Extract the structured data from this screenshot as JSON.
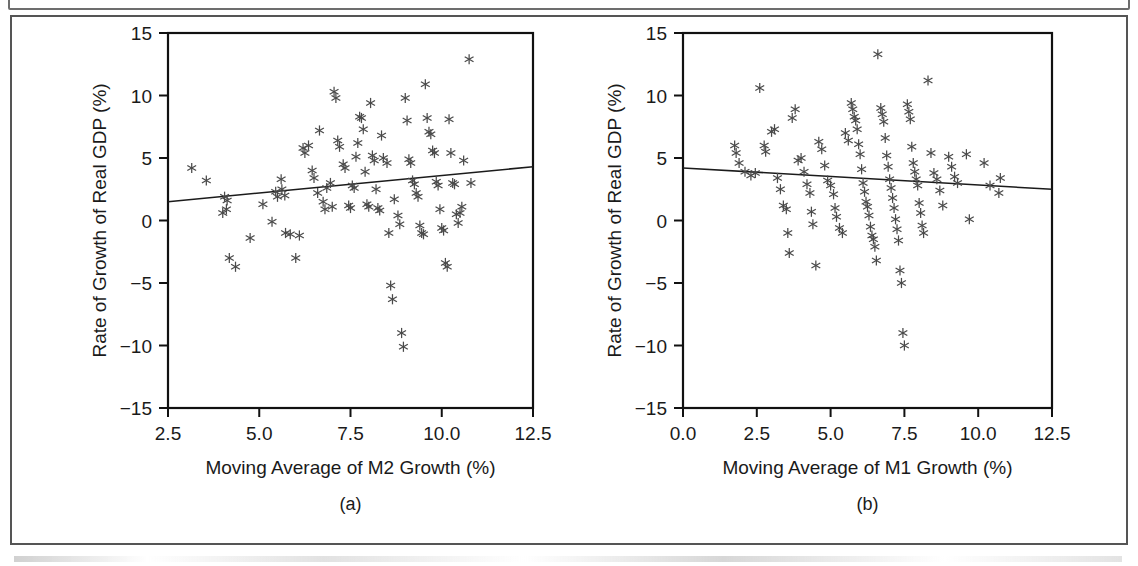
{
  "figure": {
    "panels": [
      {
        "id": "a",
        "caption": "(a)",
        "xlabel": "Moving Average of M2 Growth (%)",
        "ylabel": "Rate of Growth of Real GDP (%)",
        "xticks": [
          "2.5",
          "5.0",
          "7.5",
          "10.0",
          "12.5"
        ],
        "yticks": [
          "15",
          "10",
          "5",
          "0",
          "−5",
          "−10",
          "−15"
        ]
      },
      {
        "id": "b",
        "caption": "(b)",
        "xlabel": "Moving Average of M1 Growth (%)",
        "ylabel": "Rate of Growth of Real GDP (%)",
        "xticks": [
          "0.0",
          "2.5",
          "5.0",
          "7.5",
          "10.0",
          "12.5"
        ],
        "yticks": [
          "15",
          "10",
          "5",
          "0",
          "−5",
          "−10",
          "−15"
        ]
      }
    ]
  },
  "chart_data": [
    {
      "type": "scatter",
      "panel": "a",
      "title": "",
      "xlabel": "Moving Average of M2 Growth (%)",
      "ylabel": "Rate of Growth of Real GDP (%)",
      "xlim": [
        2.5,
        12.5
      ],
      "ylim": [
        -15,
        15
      ],
      "xticks": [
        2.5,
        5.0,
        7.5,
        10.0,
        12.5
      ],
      "yticks": [
        15,
        10,
        5,
        0,
        -5,
        -10,
        -15
      ],
      "grid": false,
      "legend": "none",
      "marker": "asterisk",
      "marker_color": "#4a4a4a",
      "fit_line": {
        "x": [
          2.5,
          12.5
        ],
        "y": [
          1.5,
          4.3
        ],
        "color": "#1b1b1b",
        "slope": 0.28,
        "intercept": 0.8
      },
      "points": [
        [
          3.15,
          4.2
        ],
        [
          3.55,
          3.2
        ],
        [
          4.05,
          1.9
        ],
        [
          4.12,
          1.6
        ],
        [
          4.0,
          0.6
        ],
        [
          4.1,
          0.9
        ],
        [
          4.18,
          -3.0
        ],
        [
          4.35,
          -3.7
        ],
        [
          4.75,
          -1.4
        ],
        [
          5.1,
          1.3
        ],
        [
          5.45,
          2.3
        ],
        [
          5.5,
          1.9
        ],
        [
          5.35,
          -0.1
        ],
        [
          5.6,
          3.3
        ],
        [
          5.62,
          2.5
        ],
        [
          5.7,
          2.0
        ],
        [
          5.72,
          -1.0
        ],
        [
          5.85,
          -1.1
        ],
        [
          6.0,
          -3.0
        ],
        [
          6.1,
          -1.2
        ],
        [
          6.2,
          5.8
        ],
        [
          6.25,
          5.4
        ],
        [
          6.35,
          6.0
        ],
        [
          6.45,
          4.0
        ],
        [
          6.5,
          3.4
        ],
        [
          6.6,
          2.2
        ],
        [
          6.65,
          7.2
        ],
        [
          6.75,
          1.5
        ],
        [
          6.8,
          0.9
        ],
        [
          6.85,
          2.6
        ],
        [
          6.95,
          3.0
        ],
        [
          7.0,
          1.1
        ],
        [
          7.05,
          10.3
        ],
        [
          7.1,
          9.8
        ],
        [
          7.15,
          6.4
        ],
        [
          7.2,
          5.9
        ],
        [
          7.3,
          4.5
        ],
        [
          7.35,
          4.2
        ],
        [
          7.45,
          1.2
        ],
        [
          7.5,
          1.0
        ],
        [
          7.55,
          2.8
        ],
        [
          7.6,
          2.6
        ],
        [
          7.65,
          5.1
        ],
        [
          7.7,
          6.2
        ],
        [
          7.75,
          8.3
        ],
        [
          7.8,
          8.2
        ],
        [
          7.85,
          7.3
        ],
        [
          7.9,
          3.9
        ],
        [
          7.95,
          1.3
        ],
        [
          8.0,
          1.1
        ],
        [
          8.05,
          9.4
        ],
        [
          8.1,
          5.2
        ],
        [
          8.15,
          4.8
        ],
        [
          8.2,
          2.5
        ],
        [
          8.25,
          1.0
        ],
        [
          8.3,
          0.8
        ],
        [
          8.35,
          6.8
        ],
        [
          8.4,
          5.0
        ],
        [
          8.5,
          4.6
        ],
        [
          8.55,
          -1.0
        ],
        [
          8.6,
          -5.2
        ],
        [
          8.65,
          -6.3
        ],
        [
          8.7,
          1.7
        ],
        [
          8.8,
          0.4
        ],
        [
          8.85,
          -0.3
        ],
        [
          8.9,
          -9.0
        ],
        [
          8.95,
          -10.1
        ],
        [
          9.0,
          9.8
        ],
        [
          9.05,
          8.0
        ],
        [
          9.1,
          4.9
        ],
        [
          9.15,
          4.6
        ],
        [
          9.2,
          3.2
        ],
        [
          9.25,
          2.9
        ],
        [
          9.3,
          2.2
        ],
        [
          9.35,
          1.9
        ],
        [
          9.4,
          -0.4
        ],
        [
          9.45,
          -1.0
        ],
        [
          9.5,
          -1.1
        ],
        [
          9.55,
          10.9
        ],
        [
          9.6,
          8.2
        ],
        [
          9.65,
          7.1
        ],
        [
          9.7,
          6.9
        ],
        [
          9.75,
          5.6
        ],
        [
          9.8,
          5.4
        ],
        [
          9.85,
          3.1
        ],
        [
          9.9,
          2.8
        ],
        [
          9.95,
          0.9
        ],
        [
          10.0,
          -0.6
        ],
        [
          10.05,
          -0.8
        ],
        [
          10.1,
          -3.4
        ],
        [
          10.15,
          -3.7
        ],
        [
          10.2,
          8.1
        ],
        [
          10.25,
          5.4
        ],
        [
          10.3,
          3.0
        ],
        [
          10.35,
          2.9
        ],
        [
          10.4,
          0.5
        ],
        [
          10.45,
          -0.2
        ],
        [
          10.5,
          0.6
        ],
        [
          10.55,
          1.1
        ],
        [
          10.6,
          4.8
        ],
        [
          10.75,
          12.9
        ],
        [
          10.8,
          3.0
        ]
      ]
    },
    {
      "type": "scatter",
      "panel": "b",
      "title": "",
      "xlabel": "Moving Average of M1 Growth (%)",
      "ylabel": "Rate of Growth of Real GDP (%)",
      "xlim": [
        0.0,
        12.5
      ],
      "ylim": [
        -15,
        15
      ],
      "xticks": [
        0.0,
        2.5,
        5.0,
        7.5,
        10.0,
        12.5
      ],
      "yticks": [
        15,
        10,
        5,
        0,
        -5,
        -10,
        -15
      ],
      "grid": false,
      "legend": "none",
      "marker": "asterisk",
      "marker_color": "#4a4a4a",
      "fit_line": {
        "x": [
          0.0,
          12.5
        ],
        "y": [
          4.2,
          2.5
        ],
        "color": "#1b1b1b",
        "slope": -0.136,
        "intercept": 4.2
      },
      "points": [
        [
          1.75,
          6.0
        ],
        [
          1.8,
          5.4
        ],
        [
          1.9,
          4.6
        ],
        [
          2.1,
          3.9
        ],
        [
          2.3,
          3.6
        ],
        [
          2.45,
          3.8
        ],
        [
          2.6,
          10.6
        ],
        [
          2.75,
          6.0
        ],
        [
          2.8,
          5.5
        ],
        [
          3.0,
          7.1
        ],
        [
          3.1,
          7.3
        ],
        [
          3.2,
          3.4
        ],
        [
          3.3,
          2.5
        ],
        [
          3.4,
          1.2
        ],
        [
          3.5,
          0.9
        ],
        [
          3.55,
          -1.0
        ],
        [
          3.6,
          -2.6
        ],
        [
          3.7,
          8.2
        ],
        [
          3.8,
          8.9
        ],
        [
          3.9,
          4.8
        ],
        [
          4.0,
          5.0
        ],
        [
          4.1,
          3.9
        ],
        [
          4.2,
          2.9
        ],
        [
          4.3,
          2.2
        ],
        [
          4.35,
          0.7
        ],
        [
          4.4,
          -0.3
        ],
        [
          4.5,
          -3.6
        ],
        [
          4.6,
          6.3
        ],
        [
          4.7,
          5.7
        ],
        [
          4.8,
          4.4
        ],
        [
          4.9,
          3.2
        ],
        [
          5.0,
          2.8
        ],
        [
          5.1,
          2.1
        ],
        [
          5.15,
          1.0
        ],
        [
          5.2,
          0.3
        ],
        [
          5.3,
          -0.6
        ],
        [
          5.4,
          -1.0
        ],
        [
          5.5,
          7.0
        ],
        [
          5.6,
          6.4
        ],
        [
          5.7,
          9.4
        ],
        [
          5.75,
          8.9
        ],
        [
          5.8,
          8.3
        ],
        [
          5.85,
          8.0
        ],
        [
          5.9,
          7.3
        ],
        [
          5.95,
          6.1
        ],
        [
          6.0,
          5.3
        ],
        [
          6.05,
          4.1
        ],
        [
          6.1,
          3.0
        ],
        [
          6.15,
          2.3
        ],
        [
          6.2,
          1.5
        ],
        [
          6.25,
          1.1
        ],
        [
          6.3,
          0.4
        ],
        [
          6.35,
          -0.5
        ],
        [
          6.4,
          -1.2
        ],
        [
          6.45,
          -1.5
        ],
        [
          6.5,
          -2.1
        ],
        [
          6.55,
          -3.2
        ],
        [
          6.6,
          13.3
        ],
        [
          6.7,
          9.0
        ],
        [
          6.75,
          8.5
        ],
        [
          6.8,
          7.9
        ],
        [
          6.85,
          6.6
        ],
        [
          6.9,
          5.2
        ],
        [
          6.95,
          4.3
        ],
        [
          7.0,
          3.3
        ],
        [
          7.05,
          2.6
        ],
        [
          7.1,
          1.8
        ],
        [
          7.15,
          1.0
        ],
        [
          7.2,
          0.1
        ],
        [
          7.25,
          -0.7
        ],
        [
          7.3,
          -1.6
        ],
        [
          7.35,
          -4.0
        ],
        [
          7.4,
          -5.0
        ],
        [
          7.45,
          -9.0
        ],
        [
          7.5,
          -10.0
        ],
        [
          7.6,
          9.3
        ],
        [
          7.65,
          8.7
        ],
        [
          7.7,
          8.1
        ],
        [
          7.75,
          5.9
        ],
        [
          7.8,
          4.6
        ],
        [
          7.85,
          3.9
        ],
        [
          7.9,
          3.3
        ],
        [
          7.95,
          2.8
        ],
        [
          8.0,
          1.4
        ],
        [
          8.05,
          0.6
        ],
        [
          8.1,
          -0.4
        ],
        [
          8.15,
          -1.0
        ],
        [
          8.3,
          11.2
        ],
        [
          8.4,
          5.4
        ],
        [
          8.5,
          3.8
        ],
        [
          8.6,
          3.3
        ],
        [
          8.7,
          2.4
        ],
        [
          8.8,
          1.2
        ],
        [
          9.0,
          5.1
        ],
        [
          9.1,
          4.3
        ],
        [
          9.2,
          3.5
        ],
        [
          9.3,
          3.0
        ],
        [
          9.6,
          5.3
        ],
        [
          9.7,
          0.1
        ],
        [
          10.2,
          4.6
        ],
        [
          10.4,
          2.8
        ],
        [
          10.7,
          2.2
        ],
        [
          10.75,
          3.4
        ]
      ]
    }
  ]
}
